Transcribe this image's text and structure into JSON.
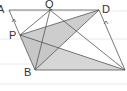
{
  "diagram": {
    "type": "geometry",
    "labels": {
      "A": "A",
      "Q": "Q",
      "D": "D",
      "P": "P",
      "B": "B"
    },
    "points": {
      "A": [
        9,
        10
      ],
      "Q": [
        50,
        10
      ],
      "D": [
        99,
        10
      ],
      "P": [
        20,
        35
      ],
      "B": [
        35,
        70
      ],
      "C": [
        125,
        70
      ]
    },
    "shaded_regions": [
      "triangle PDB",
      "triangle PBC"
    ],
    "colors": {
      "line": "#555555",
      "shade_dark": "#a9a9a9",
      "shade_light": "#cfcfcf",
      "ruled": "#e2e2e2"
    }
  }
}
